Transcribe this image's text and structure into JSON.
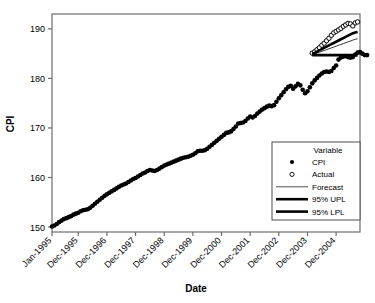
{
  "chart_data": {
    "type": "line",
    "title": "",
    "xlabel": "Date",
    "ylabel": "CPI",
    "ylim": [
      149,
      193
    ],
    "yticks": [
      150,
      160,
      170,
      180,
      190
    ],
    "grid": false,
    "legend": {
      "position": "bottom-right",
      "title": "Variable",
      "entries": [
        {
          "label": "CPI",
          "marker": "filled-circle"
        },
        {
          "label": "Actual",
          "marker": "open-circle"
        },
        {
          "label": "Forecast",
          "marker": "thin-line"
        },
        {
          "label": "95% UPL",
          "marker": "thick-line"
        },
        {
          "label": "95% LPL",
          "marker": "thick-line"
        }
      ]
    },
    "xticklabels": [
      "Jan-1995",
      "Dec-1995",
      "Dec-1996",
      "Dec-1997",
      "Dec-1998",
      "Dec-1999",
      "Dec-2000",
      "Dec-2001",
      "Dec-2002",
      "Dec-2003",
      "Dec-2004"
    ],
    "xtick_indices": [
      0,
      11,
      23,
      35,
      47,
      59,
      71,
      83,
      95,
      107,
      119
    ],
    "series": [
      {
        "name": "CPI",
        "marker": "filled-circle",
        "x_start_index": 0,
        "values": [
          150.1,
          150.3,
          150.6,
          151.0,
          151.3,
          151.6,
          151.8,
          152.0,
          152.2,
          152.5,
          152.7,
          152.9,
          153.2,
          153.4,
          153.5,
          153.6,
          153.9,
          154.3,
          154.7,
          155.1,
          155.5,
          155.9,
          156.3,
          156.6,
          156.9,
          157.2,
          157.5,
          157.8,
          158.1,
          158.4,
          158.6,
          158.8,
          159.1,
          159.4,
          159.7,
          159.9,
          160.2,
          160.5,
          160.8,
          161.0,
          161.3,
          161.5,
          161.4,
          161.3,
          161.5,
          161.8,
          162.1,
          162.4,
          162.6,
          162.8,
          163.0,
          163.2,
          163.4,
          163.6,
          163.8,
          164.0,
          164.1,
          164.2,
          164.4,
          164.6,
          164.9,
          165.3,
          165.4,
          165.4,
          165.5,
          165.8,
          166.2,
          166.6,
          167.0,
          167.4,
          167.8,
          168.2,
          168.6,
          169.0,
          169.1,
          169.3,
          169.8,
          170.3,
          170.9,
          171.0,
          171.1,
          171.4,
          171.9,
          172.3,
          172.1,
          172.4,
          172.9,
          173.3,
          173.7,
          174.0,
          174.3,
          174.5,
          174.4,
          174.6,
          175.3,
          176.0,
          176.6,
          177.2,
          177.8,
          178.3,
          178.5,
          177.9,
          178.4,
          178.9,
          178.6,
          177.7,
          177.0,
          177.4,
          178.2,
          179.0,
          179.6,
          180.1,
          180.6,
          181.0,
          181.3,
          181.4,
          181.3,
          181.5,
          182.1,
          182.6,
          183.8,
          184.2,
          184.4,
          184.5,
          184.3,
          184.2,
          184.3,
          184.8,
          185.2,
          185.3,
          185.0,
          184.7,
          184.7
        ]
      },
      {
        "name": "Actual",
        "marker": "open-circle",
        "x_start_index": 109,
        "values": [
          185.1,
          185.4,
          185.8,
          186.2,
          186.7,
          187.1,
          187.6,
          188.1,
          188.7,
          189.2,
          189.5,
          189.8,
          190.1,
          190.5,
          190.8,
          191.1,
          191.0,
          190.6,
          191.2,
          191.4
        ]
      },
      {
        "name": "Forecast",
        "marker": "thin-line",
        "x_start_index": 109,
        "values": [
          184.75,
          184.93,
          185.1,
          185.28,
          185.45,
          185.63,
          185.8,
          185.98,
          186.15,
          186.33,
          186.5,
          186.68,
          186.85,
          187.03,
          187.2,
          187.38,
          187.55,
          187.73,
          187.9,
          188.0
        ]
      },
      {
        "name": "95% UPL",
        "marker": "thick-line",
        "x_start_index": 109,
        "values": [
          184.9,
          185.15,
          185.4,
          185.65,
          185.9,
          186.15,
          186.4,
          186.65,
          186.9,
          187.15,
          187.4,
          187.65,
          187.9,
          188.15,
          188.4,
          188.65,
          188.9,
          189.1,
          189.25,
          189.35
        ]
      },
      {
        "name": "95% LPL",
        "marker": "thick-line",
        "x_start_index": 109,
        "values": [
          184.7,
          184.7,
          184.7,
          184.7,
          184.7,
          184.7,
          184.7,
          184.7,
          184.7,
          184.7,
          184.7,
          184.7,
          184.7,
          184.7,
          184.7,
          184.7,
          184.7,
          184.7,
          184.7,
          184.7
        ]
      }
    ]
  }
}
